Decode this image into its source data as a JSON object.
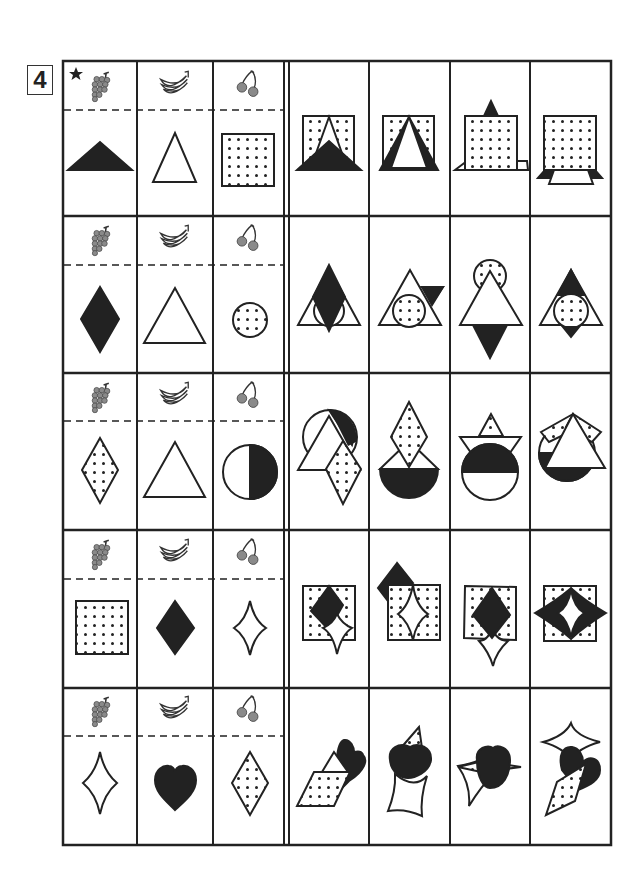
{
  "worksheet": {
    "problem_number": "4",
    "star_marker": "example-row",
    "key_columns": [
      {
        "fruit": "grape",
        "icon": "grape-icon"
      },
      {
        "fruit": "banana",
        "icon": "banana-icon"
      },
      {
        "fruit": "cherry",
        "icon": "cherry-icon"
      }
    ],
    "rows": [
      {
        "index": 1,
        "is_example": true,
        "key_shapes": [
          "black-triangle-wide",
          "white-triangle",
          "dotted-square"
        ],
        "options": [
          "option-a",
          "option-b",
          "option-c",
          "option-d"
        ]
      },
      {
        "index": 2,
        "is_example": false,
        "key_shapes": [
          "black-diamond",
          "white-triangle",
          "dotted-circle"
        ],
        "options": [
          "option-a",
          "option-b",
          "option-c",
          "option-d"
        ]
      },
      {
        "index": 3,
        "is_example": false,
        "key_shapes": [
          "dotted-diamond",
          "white-triangle",
          "half-black-circle-vertical"
        ],
        "options": [
          "option-a",
          "option-b",
          "option-c",
          "option-d"
        ]
      },
      {
        "index": 4,
        "is_example": false,
        "key_shapes": [
          "dotted-square",
          "black-diamond",
          "white-concave-diamond"
        ],
        "options": [
          "option-a",
          "option-b",
          "option-c",
          "option-d"
        ]
      },
      {
        "index": 5,
        "is_example": false,
        "key_shapes": [
          "white-concave-diamond",
          "black-heart",
          "dotted-diamond"
        ],
        "options": [
          "option-a",
          "option-b",
          "option-c",
          "option-d"
        ]
      }
    ],
    "colors": {
      "ink": "#222222",
      "paper": "#ffffff",
      "fruit_gray": "#8a8a8a"
    }
  }
}
